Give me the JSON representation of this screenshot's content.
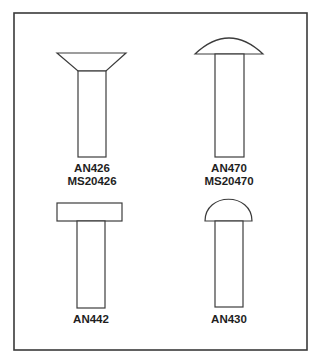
{
  "diagram": {
    "type": "rivet-head-styles",
    "frame_color": "#3a3a3a",
    "stroke_color": "#3c3c3c",
    "rivets": [
      {
        "id": "countersunk",
        "head": "countersunk-100",
        "labels": [
          "AN426",
          "MS20426"
        ]
      },
      {
        "id": "universal",
        "head": "universal",
        "labels": [
          "AN470",
          "MS20470"
        ]
      },
      {
        "id": "flathead",
        "head": "flat",
        "labels": [
          "AN442"
        ]
      },
      {
        "id": "roundhead",
        "head": "round",
        "labels": [
          "AN430"
        ]
      }
    ]
  }
}
